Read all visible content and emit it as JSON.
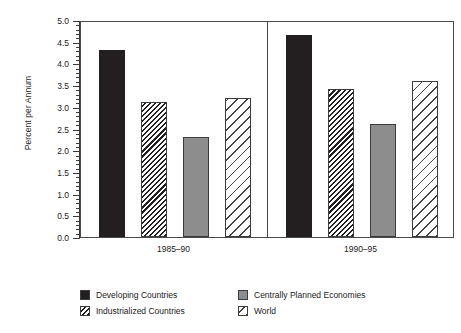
{
  "chart_data": {
    "type": "bar",
    "title": "",
    "subtitle": "",
    "xlabel": "",
    "ylabel": "Percent per Annum",
    "ylim": [
      0.0,
      5.0
    ],
    "ytick_step": 0.5,
    "yminor_step": 0.1,
    "grid": false,
    "legend_position": "bottom",
    "categories": [
      "1985–90",
      "1990–95"
    ],
    "tick_labels": [
      "0.0",
      "0.5",
      "1.0",
      "1.5",
      "2.0",
      "2.5",
      "3.0",
      "3.5",
      "4.0",
      "4.5",
      "5.0"
    ],
    "series": [
      {
        "name": "Developing Countries",
        "fill": "solid-dark",
        "color": "#231f20",
        "values": [
          4.3,
          4.65
        ]
      },
      {
        "name": "Industrialized Countries",
        "fill": "hatch-dense",
        "color": "#231f20",
        "values": [
          3.1,
          3.4
        ]
      },
      {
        "name": "Centrally Planned Economies",
        "fill": "gray",
        "color": "#8d8d8d",
        "values": [
          2.3,
          2.6
        ]
      },
      {
        "name": "World",
        "fill": "hatch-open",
        "color": "#444444",
        "values": [
          3.2,
          3.6
        ]
      }
    ]
  },
  "axis": {
    "y_title": "Percent per Annum",
    "y_ticks": [
      "5.0",
      "4.5",
      "4.0",
      "3.5",
      "3.0",
      "2.5",
      "2.0",
      "1.5",
      "1.0",
      "0.5",
      "0.0"
    ],
    "x_groups": [
      "1985–90",
      "1990–95"
    ]
  },
  "legend": {
    "items": [
      {
        "label": "Developing Countries",
        "fill": "solid-dark"
      },
      {
        "label": "Centrally Planned Economies",
        "fill": "gray"
      },
      {
        "label": "Industrialized Countries",
        "fill": "hatch-dense"
      },
      {
        "label": "World",
        "fill": "hatch-open"
      }
    ]
  },
  "colors": {
    "bar_dark": "#231f20",
    "bar_gray": "#8d8d8d",
    "axis": "#3a3a3a",
    "frame": "#4a4a4a",
    "background": "#ffffff"
  }
}
